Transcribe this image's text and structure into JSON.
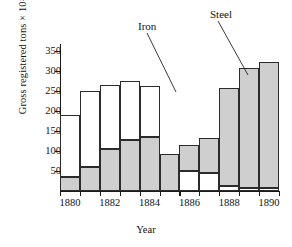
{
  "chart_data": {
    "type": "bar",
    "title": "",
    "subtitle": "",
    "xlabel": "Year",
    "ylabel": "Gross registered tons × 10",
    "ylabel_exponent": "3",
    "ylim": [
      0,
      375
    ],
    "yticks": [
      50,
      100,
      150,
      200,
      250,
      300,
      350
    ],
    "ytick_labels": [
      "50",
      "100",
      "150",
      "200",
      "250",
      "300",
      "350"
    ],
    "grid": false,
    "legend_position": "annotation-callouts",
    "stacked": true,
    "categories": [
      1880,
      1881,
      1882,
      1883,
      1884,
      1885,
      1886,
      1887,
      1888,
      1889,
      1890
    ],
    "xtick_labels": [
      "1880",
      "1882",
      "1884",
      "1886",
      "1888",
      "1890"
    ],
    "xtick_values": [
      1880,
      1882,
      1884,
      1886,
      1888,
      1890
    ],
    "series": [
      {
        "name": "Steel",
        "fill": "shaded-stipple",
        "color": "#cfcfcf",
        "values": [
          37,
          62,
          107,
          129,
          137,
          94,
          66,
          90,
          250,
          307,
          323
        ]
      },
      {
        "name": "Iron",
        "fill": "white",
        "color": "#ffffff",
        "values": [
          156,
          192,
          164,
          151,
          132,
          0,
          51,
          45,
          13,
          8,
          7
        ]
      }
    ],
    "totals": [
      193,
      254,
      271,
      280,
      269,
      94,
      117,
      135,
      263,
      315,
      330
    ],
    "steel_on_top": [
      false,
      false,
      false,
      false,
      false,
      true,
      true,
      true,
      true,
      true,
      true
    ],
    "annotations": [
      {
        "text": "Iron",
        "label_x": 138,
        "label_y": 20,
        "line_x1": 147,
        "line_y1": 33,
        "line_x2": 176,
        "line_y2": 92
      },
      {
        "text": "Steel",
        "label_x": 210,
        "label_y": 8,
        "line_x1": 218,
        "line_y1": 21,
        "line_x2": 248,
        "line_y2": 75
      }
    ]
  }
}
